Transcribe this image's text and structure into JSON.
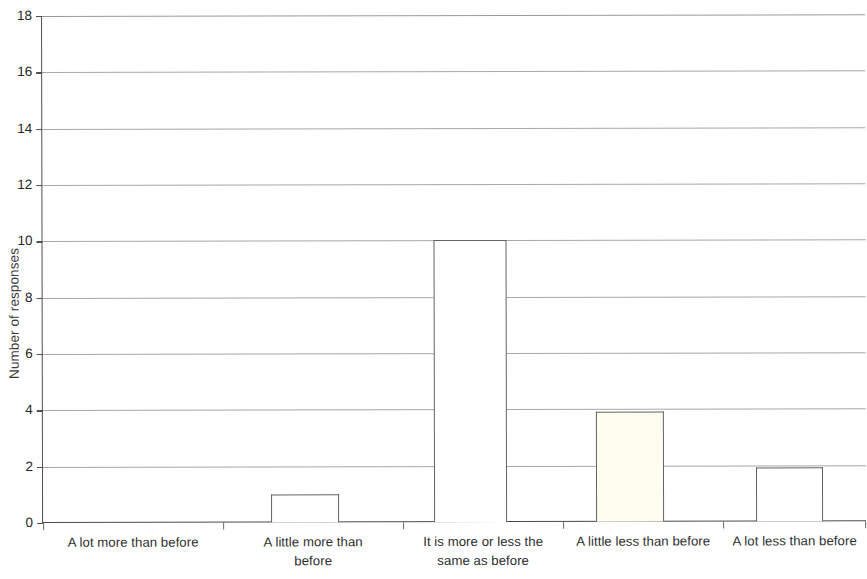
{
  "chart_data": {
    "type": "bar",
    "title": "",
    "subtitle": "",
    "xlabel": "",
    "ylabel": "Number of responses",
    "categories": [
      "A lot more than before",
      "A little more than before",
      "It is more or less the same as before",
      "A little less than before",
      "A lot less than before"
    ],
    "values": [
      0,
      1,
      10,
      3.9,
      1.9
    ],
    "ylim": [
      0,
      18
    ],
    "yticks": [
      0,
      2,
      4,
      6,
      8,
      10,
      12,
      14,
      16,
      18
    ],
    "ytick_labels": [
      "0",
      "2",
      "4",
      "6",
      "8",
      "10",
      "12",
      "14",
      "16",
      "18"
    ],
    "grid": true,
    "legend": null,
    "bar_fill_colors": [
      "#ffffff",
      "#ffffff",
      "#ffffff",
      "#fdfdf0",
      "#ffffff"
    ],
    "bar_border_color": "#636363",
    "gridline_color": "#a8a8a8",
    "axis_color": "#4f4f4f"
  },
  "axis": {
    "y_title": "Number of responses"
  },
  "x_label_lines": [
    [
      "A lot more than before"
    ],
    [
      "A little more than",
      "before"
    ],
    [
      "It is more or less the",
      "same as before"
    ],
    [
      "A little less than before"
    ],
    [
      "A lot less than before"
    ]
  ]
}
